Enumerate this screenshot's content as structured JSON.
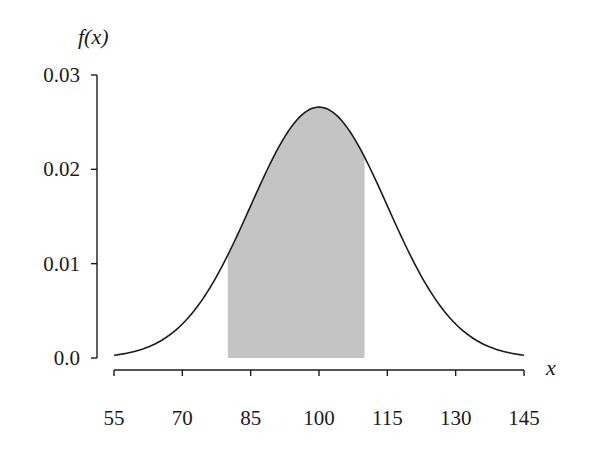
{
  "chart_data": {
    "type": "area",
    "title": "",
    "xlabel": "x",
    "ylabel": "f(x)",
    "distribution": "normal",
    "mean": 100,
    "std_dev": 15,
    "xlim": [
      55,
      145
    ],
    "ylim": [
      0,
      0.03
    ],
    "x_ticks": [
      55,
      70,
      85,
      100,
      115,
      130,
      145
    ],
    "x_tick_labels": [
      "55",
      "70",
      "85",
      "100",
      "115",
      "130",
      "145"
    ],
    "y_ticks": [
      0.0,
      0.01,
      0.02,
      0.03
    ],
    "y_tick_labels": [
      "0.0",
      "0.01",
      "0.02",
      "0.03"
    ],
    "shaded_region": {
      "from": 80,
      "to": 110
    },
    "peak": {
      "x": 100,
      "y": 0.0266
    },
    "grid": false,
    "legend": null,
    "colors": {
      "curve": "#1a1a1a",
      "shade": "#c4c4c4",
      "axis": "#1a1a1a"
    }
  },
  "axes": {
    "y_title": "f(x)",
    "x_title": "x"
  }
}
